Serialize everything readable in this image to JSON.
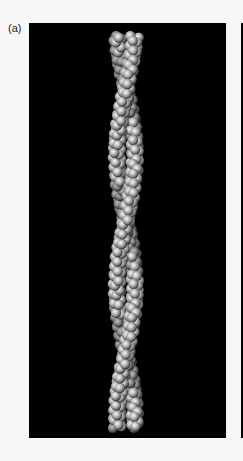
{
  "figure": {
    "label": "(a)",
    "colors": {
      "background": "#f7f7f7",
      "panel": "#000000",
      "sphere_light": "#f0f0f0",
      "sphere_mid": "#a8a8a8",
      "sphere_dark": "#3a3a3a"
    },
    "helix": {
      "strands": 2,
      "top_y": 31,
      "bottom_y": 432,
      "center_x": 126,
      "half_width": 9,
      "crossover_points_y": [
        88,
        220,
        368
      ]
    }
  }
}
